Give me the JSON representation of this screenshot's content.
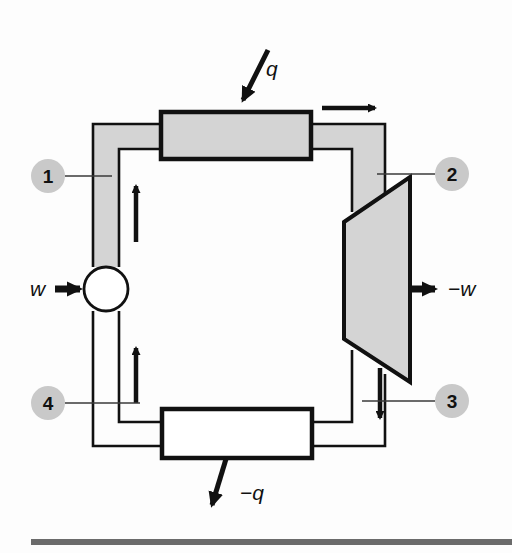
{
  "figure": {
    "name": "rankine-cycle-schematic",
    "background_color": "#fdfdfd"
  },
  "colors": {
    "outline": "#111111",
    "component_fill_gray": "#d4d4d4",
    "component_fill_white": "#ffffff",
    "pipe_fill_gray": "#d4d4d4",
    "pipe_fill_white": "#ffffff",
    "state_circle_fill": "#c9c9c9",
    "leader_line": "#3a3a3a",
    "rule_color": "#6b6b6b"
  },
  "components": {
    "boiler": {
      "name": "boiler",
      "label": "",
      "fill": "#d4d4d4",
      "x": 161,
      "y": 112,
      "width": 150,
      "height": 47
    },
    "condenser": {
      "name": "condenser",
      "label": "",
      "fill": "#ffffff",
      "x": 162,
      "y": 409,
      "width": 150,
      "height": 49
    },
    "turbine": {
      "name": "turbine",
      "label": "",
      "fill": "#d4d4d4",
      "points": "344,222 410,177 410,382 344,339"
    },
    "pump": {
      "name": "pump",
      "label": "",
      "fill": "#ffffff",
      "cx": 106,
      "cy": 289,
      "r": 22
    }
  },
  "energy_flows": [
    {
      "id": "heat-in",
      "name": "heat-input-arrow",
      "label": "q",
      "direction": "into-boiler",
      "label_x": 268,
      "label_y": 76
    },
    {
      "id": "heat-out",
      "name": "heat-rejected-arrow",
      "label": "−q",
      "direction": "out-of-condenser",
      "label_x": 247,
      "label_y": 500
    },
    {
      "id": "work-in",
      "name": "pump-work-input-arrow",
      "label": "w",
      "direction": "into-pump",
      "label_x": 32,
      "label_y": 296
    },
    {
      "id": "work-out",
      "name": "turbine-work-output-arrow",
      "label": "−w",
      "direction": "out-of-turbine",
      "label_x": 455,
      "label_y": 296
    }
  ],
  "state_points": [
    {
      "id": "1",
      "name": "state-point-1",
      "label": "1",
      "cx": 48,
      "cy": 176,
      "r": 17,
      "leader_x1": 65,
      "leader_x2": 112,
      "leader_y": 176
    },
    {
      "id": "2",
      "name": "state-point-2",
      "label": "2",
      "cx": 452,
      "cy": 174,
      "r": 17,
      "leader_x1": 435,
      "leader_x2": 377,
      "leader_y": 174
    },
    {
      "id": "3",
      "name": "state-point-3",
      "label": "3",
      "cx": 452,
      "cy": 401,
      "r": 17,
      "leader_x1": 435,
      "leader_x2": 362,
      "leader_y": 401
    },
    {
      "id": "4",
      "name": "state-point-4",
      "label": "4",
      "cx": 48,
      "cy": 403,
      "r": 17,
      "leader_x1": 65,
      "leader_x2": 140,
      "leader_y": 403
    }
  ],
  "flow_direction_arrows": [
    {
      "name": "flow-arrow-upper-left-riser",
      "orientation": "up"
    },
    {
      "name": "flow-arrow-lower-left-riser",
      "orientation": "up"
    },
    {
      "name": "flow-arrow-boiler-exit",
      "orientation": "right"
    },
    {
      "name": "flow-arrow-turbine-exit",
      "orientation": "down"
    }
  ],
  "footer_rule": {
    "name": "bottom-horizontal-rule",
    "x": 31,
    "y": 539,
    "width": 481,
    "height": 6,
    "color": "#6b6b6b"
  }
}
